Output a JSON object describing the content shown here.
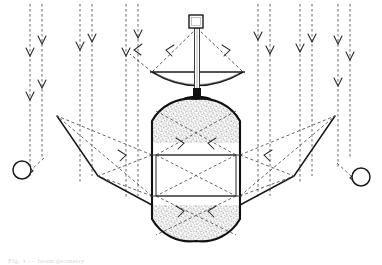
{
  "figure": {
    "caption": "Fig. — Schematic of beam paths",
    "colors": {
      "solid_line": "#1a1a1a",
      "dashed_ray": "#4a4a4a",
      "vessel_outline": "#111111",
      "stipple": "#555555",
      "background": "#ffffff",
      "caption": "#d8d8d8"
    }
  },
  "components": {
    "feed_horn": {
      "name": "feed-horn",
      "label": "",
      "shape": "square",
      "x": 194,
      "y": 22,
      "size": 13
    },
    "mast": {
      "name": "support-mast",
      "label": "",
      "top_y": 28,
      "bottom_y": 90
    },
    "dish": {
      "name": "parabolic-dish",
      "label": "",
      "rim_left_x": 152,
      "rim_right_x": 243,
      "rim_y": 72,
      "vertex_y": 90
    },
    "stem": {
      "name": "dish-vessel-stem",
      "label": "",
      "top_y": 88,
      "bottom_y": 100
    },
    "vessel": {
      "name": "capsule-vessel",
      "label": "",
      "left_x": 152,
      "right_x": 240,
      "top_y": 99,
      "bottom_y": 241,
      "corner_radius": 44
    },
    "inner_rectangle": {
      "name": "vessel-inner-rectangle",
      "label": "",
      "left_x": 156,
      "right_x": 236,
      "top_y": 155,
      "bottom_y": 196
    },
    "stipple_top": {
      "name": "stipple-region-top",
      "label": "",
      "dot_count": 340
    },
    "stipple_bottom": {
      "name": "stipple-region-bottom",
      "label": "",
      "dot_count": 300
    },
    "circle_left": {
      "name": "marker-circle-left",
      "label": "",
      "cx": 22,
      "cy": 170,
      "r": 9
    },
    "circle_right": {
      "name": "marker-circle-right",
      "label": "",
      "cx": 361,
      "cy": 177,
      "r": 9
    }
  },
  "beams": {
    "vertical_dashed_pairs": [
      {
        "name": "beam-pair-1",
        "x_left": 30,
        "x_right": 42,
        "top": 4,
        "bottom": 175
      },
      {
        "name": "beam-pair-2",
        "x_left": 80,
        "x_right": 92,
        "top": 4,
        "bottom": 180
      },
      {
        "name": "beam-pair-3",
        "x_left": 126,
        "x_right": 138,
        "top": 4,
        "bottom": 196
      },
      {
        "name": "beam-pair-4",
        "x_left": 258,
        "x_right": 270,
        "top": 4,
        "bottom": 196
      },
      {
        "name": "beam-pair-5",
        "x_left": 300,
        "x_right": 312,
        "top": 4,
        "bottom": 180
      },
      {
        "name": "beam-pair-6",
        "x_left": 338,
        "x_right": 350,
        "top": 4,
        "bottom": 172
      }
    ],
    "arrow_marker": "v-arrowhead-down",
    "arrow_count_per_line": 2
  },
  "caption": {
    "line": "Fig. 1 — beam geometry"
  }
}
